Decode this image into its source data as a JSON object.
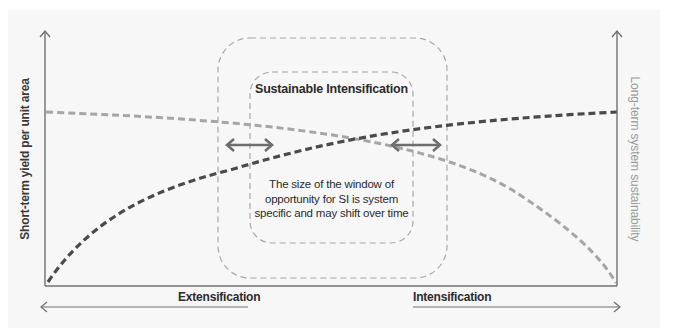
{
  "diagram": {
    "title": "Sustainable Intensification",
    "note": "The size of the window of opportunity for SI is system specific and may shift over time",
    "left_axis_label": "Short-term yield per unit area",
    "right_axis_label": "Long-term system sustainability",
    "bottom_left_label": "Extensification",
    "bottom_right_label": "Intensification",
    "curves": [
      {
        "name": "Short-term yield per unit area",
        "style": "dark dashed",
        "color": "#4a4a4a",
        "shape": "rising, concave down",
        "start": "low at extensification",
        "end": "high at intensification"
      },
      {
        "name": "Long-term system sustainability",
        "style": "light dashed",
        "color": "#a6a6a6",
        "shape": "falling, concave down",
        "start": "high at extensification",
        "end": "low at intensification"
      }
    ],
    "windows": [
      {
        "name": "outer window",
        "style": "dashed rounded rectangle"
      },
      {
        "name": "inner window",
        "style": "dashed rounded rectangle"
      }
    ],
    "arrows": [
      {
        "name": "left window boundary shift",
        "type": "double-headed"
      },
      {
        "name": "right window boundary shift",
        "type": "double-headed"
      }
    ],
    "colors": {
      "background": "#f7f7f7",
      "axis": "#707070",
      "dark_curve": "#4a4a4a",
      "light_curve": "#a6a6a6",
      "window_border": "#a8a8a8",
      "arrow": "#6e6e6e",
      "text": "#2b2b2b",
      "right_label": "#9a9a9a"
    }
  }
}
